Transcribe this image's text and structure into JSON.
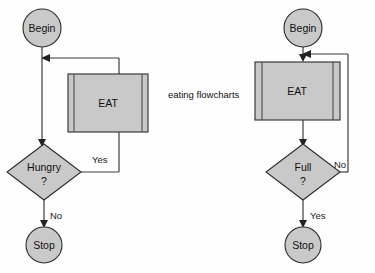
{
  "caption": {
    "text": "eating flowcharts",
    "x": 168,
    "y": 95
  },
  "diagrams": [
    {
      "id": "hungry-loop",
      "nodes": {
        "begin": {
          "label": "Begin",
          "shape": "terminator-circle",
          "cx": 42,
          "cy": 28,
          "r": 19
        },
        "process": {
          "label": "EAT",
          "shape": "predefined-process",
          "x": 68,
          "y": 74,
          "w": 80,
          "h": 58
        },
        "decision": {
          "label": "Hungry",
          "label2": "?",
          "shape": "diamond",
          "cx": 44,
          "cy": 172,
          "rx": 37,
          "ry": 28
        },
        "stop": {
          "label": "Stop",
          "shape": "terminator-circle",
          "cx": 44,
          "cy": 245,
          "r": 18
        }
      },
      "edges": [
        {
          "from": "begin",
          "to": "decision",
          "label": ""
        },
        {
          "from": "decision",
          "to": "process",
          "label": "Yes",
          "label_x": 92,
          "label_y": 160
        },
        {
          "from": "process",
          "to": "begin-to-decision",
          "label": ""
        },
        {
          "from": "decision",
          "to": "stop",
          "label": "No",
          "label_x": 49,
          "label_y": 217
        }
      ]
    },
    {
      "id": "full-loop",
      "nodes": {
        "begin": {
          "label": "Begin",
          "shape": "terminator-circle",
          "cx": 303,
          "cy": 28,
          "r": 19
        },
        "process": {
          "label": "EAT",
          "shape": "predefined-process",
          "x": 255,
          "y": 62,
          "w": 85,
          "h": 58
        },
        "decision": {
          "label": "Full",
          "label2": "?",
          "shape": "diamond",
          "cx": 303,
          "cy": 172,
          "rx": 37,
          "ry": 28
        },
        "stop": {
          "label": "Stop",
          "shape": "terminator-circle",
          "cx": 303,
          "cy": 245,
          "r": 18
        }
      },
      "edges": [
        {
          "from": "begin",
          "to": "process",
          "label": ""
        },
        {
          "from": "process",
          "to": "decision",
          "label": ""
        },
        {
          "from": "decision",
          "to": "process-entry",
          "label": "No",
          "label_x": 334,
          "label_y": 165
        },
        {
          "from": "decision",
          "to": "stop",
          "label": "Yes",
          "label_x": 310,
          "label_y": 217
        }
      ]
    }
  ],
  "colors": {
    "shape_fill": "#c9c9c9",
    "bar_fill": "#bdbdbd",
    "stroke": "#2b2b2b",
    "connector": "#3c3c3c",
    "text": "#111111",
    "background": "#fefefe"
  }
}
